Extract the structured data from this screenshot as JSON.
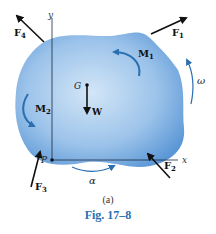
{
  "figure": {
    "sub_label": "(a)",
    "caption": "Fig. 17–8"
  },
  "labels": {
    "y_axis": "y",
    "x_axis": "x",
    "point_p": "P",
    "point_g": "G",
    "weight": "W",
    "force_1": "F",
    "force_1_sub": "1",
    "force_2": "F",
    "force_2_sub": "2",
    "force_3": "F",
    "force_3_sub": "3",
    "force_4": "F",
    "force_4_sub": "4",
    "moment_1": "M",
    "moment_1_sub": "1",
    "moment_2": "M",
    "moment_2_sub": "2",
    "omega": "ω",
    "alpha": "α"
  },
  "colors": {
    "body_light": "#c9dff4",
    "body_dark": "#5b97d6",
    "curl_arrow": "#2a6fb0",
    "force_arrow": "#111111",
    "caption": "#2a6fb0"
  }
}
